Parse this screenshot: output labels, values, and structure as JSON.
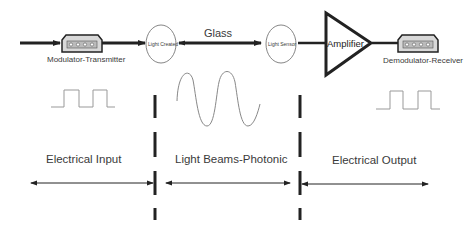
{
  "diagram": {
    "components": {
      "modulator_transmitter": "Modulator-Transmitter",
      "light_created": "Light Created",
      "glass": "Glass",
      "light_sensor": "Light Sensor",
      "amplifier": "Amplifier",
      "demodulator_receiver": "Demodulator-Receiver"
    },
    "sections": [
      {
        "label": "Electrical Input",
        "signal": "square-wave"
      },
      {
        "label": "Light Beams-Photonic",
        "signal": "sine-wave"
      },
      {
        "label": "Electrical Output",
        "signal": "square-wave"
      }
    ],
    "colors": {
      "line": "#222222",
      "signal": "#888888",
      "connector_fill": "#d8d8d8"
    }
  }
}
